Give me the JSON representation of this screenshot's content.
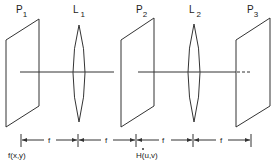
{
  "diagram": {
    "type": "4f optical correlator",
    "planes": [
      {
        "id": "P1",
        "label": "P",
        "sub": "1",
        "x": 6
      },
      {
        "id": "P2",
        "label": "P",
        "sub": "2",
        "x": 121
      },
      {
        "id": "P3",
        "label": "P",
        "sub": "3",
        "x": 236
      }
    ],
    "lenses": [
      {
        "id": "L1",
        "label": "L",
        "sub": "1",
        "x": 79
      },
      {
        "id": "L2",
        "label": "L",
        "sub": "2",
        "x": 194
      }
    ],
    "distances": [
      "f",
      "f",
      "f",
      "f"
    ],
    "functions": {
      "input": "f(x,y)",
      "filter": "H(u,v)"
    },
    "colors": {
      "line": "#333333",
      "background": "#ffffff"
    }
  }
}
